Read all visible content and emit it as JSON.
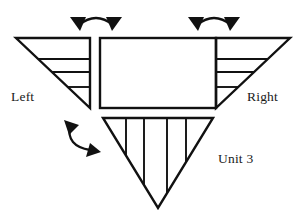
{
  "diagram": {
    "background_color": "#ffffff",
    "stroke_color": "#111111",
    "labels": {
      "left": "Left",
      "right": "Right",
      "unit": "Unit 3"
    },
    "shapes": [
      {
        "name": "left-wing-triangle",
        "type": "right-triangle",
        "orientation": "apex-bottom-right",
        "internal_lines": 3,
        "internal_line_direction": "horizontal"
      },
      {
        "name": "center-body-rectangle",
        "type": "rectangle",
        "internal_lines": 0
      },
      {
        "name": "right-wing-triangle",
        "type": "right-triangle",
        "orientation": "apex-bottom-left",
        "internal_lines": 3,
        "internal_line_direction": "horizontal"
      },
      {
        "name": "bottom-unit-triangle",
        "type": "inverted-triangle",
        "orientation": "apex-bottom",
        "internal_lines": 4,
        "internal_line_direction": "vertical"
      }
    ],
    "arrows": [
      {
        "name": "top-left-articulation-arrow",
        "style": "curved-double-headed",
        "heads": 2,
        "position": "above-left-joint"
      },
      {
        "name": "top-right-articulation-arrow",
        "style": "curved-double-headed",
        "heads": 2,
        "position": "above-right-joint"
      },
      {
        "name": "bottom-left-articulation-arrow",
        "style": "curved-double-headed",
        "heads": 2,
        "position": "below-left-joint"
      }
    ]
  }
}
